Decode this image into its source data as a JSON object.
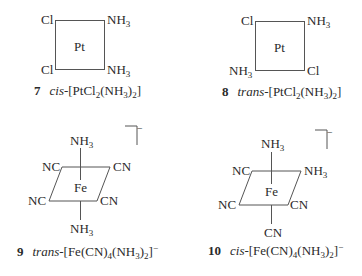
{
  "structures": [
    {
      "number": "7",
      "prefix": "cis-",
      "formula_parts": [
        "[PtCl",
        "2",
        "(NH",
        "3",
        ")",
        "2",
        "]"
      ],
      "charge": "",
      "center": "Pt",
      "ligands": {
        "top_left": "Cl",
        "top_right": "NH",
        "top_right_sub": "3",
        "bottom_left": "Cl",
        "bottom_right": "NH",
        "bottom_right_sub": "3"
      }
    },
    {
      "number": "8",
      "prefix": "trans-",
      "formula_parts": [
        "[PtCl",
        "2",
        "(NH",
        "3",
        ")",
        "2",
        "]"
      ],
      "charge": "",
      "center": "Pt",
      "ligands": {
        "top_left": "Cl",
        "top_right": "NH",
        "top_right_sub": "3",
        "bottom_left": "NH",
        "bottom_left_sub": "3",
        "bottom_right": "Cl"
      }
    },
    {
      "number": "9",
      "prefix": "trans-",
      "formula_parts": [
        "[Fe(CN)",
        "4",
        "(NH",
        "3",
        ")",
        "2",
        "]"
      ],
      "charge": "−",
      "bracket_charge": "−",
      "center": "Fe",
      "ligands": {
        "axial_top": "NH",
        "axial_top_sub": "3",
        "axial_bottom": "NH",
        "axial_bottom_sub": "3",
        "eq_back_left": "NC",
        "eq_back_right": "CN",
        "eq_front_left": "NC",
        "eq_front_right": "CN"
      }
    },
    {
      "number": "10",
      "prefix": "cis-",
      "formula_parts": [
        "[Fe(CN)",
        "4",
        "(NH",
        "3",
        ")",
        "2",
        "]"
      ],
      "charge": "−",
      "bracket_charge": "−",
      "center": "Fe",
      "ligands": {
        "axial_top": "NH",
        "axial_top_sub": "3",
        "axial_bottom": "CN",
        "eq_back_left": "NC",
        "eq_back_right": "NH",
        "eq_back_right_sub": "3",
        "eq_front_left": "NC",
        "eq_front_right": "CN"
      }
    }
  ]
}
